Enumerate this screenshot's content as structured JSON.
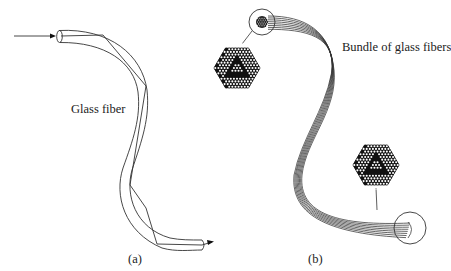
{
  "figure": {
    "panel_a": {
      "label": "Glass fiber",
      "caption": "(a)"
    },
    "panel_b": {
      "label": "Bundle of glass fibers",
      "caption": "(b)"
    }
  },
  "colors": {
    "line": "#333333",
    "fill_dark": "#111111",
    "background": "#ffffff"
  }
}
